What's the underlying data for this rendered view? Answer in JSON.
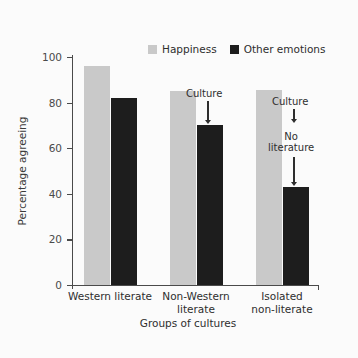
{
  "chart_data": {
    "type": "bar",
    "title": "",
    "xlabel": "Groups of cultures",
    "ylabel": "Percentage agreeing",
    "ylim": [
      0,
      100
    ],
    "yticks": [
      0,
      20,
      40,
      60,
      80,
      100
    ],
    "grid": false,
    "legend_position": "top-center",
    "categories": [
      "Western literate",
      "Non-Western\nliterate",
      "Isolated\nnon-literate"
    ],
    "series": [
      {
        "name": "Happiness",
        "color": "#c9c9c9",
        "values": [
          96,
          85,
          85.5
        ]
      },
      {
        "name": "Other emotions",
        "color": "#1d1d1d",
        "values": [
          82,
          70,
          43
        ]
      }
    ],
    "annotations": [
      {
        "text": "Culture",
        "target_group": 1,
        "target_series": "Other emotions",
        "target_value": 70
      },
      {
        "text": "Culture",
        "target_group": 2,
        "target_series": "Other emotions",
        "target_value": 70
      },
      {
        "text": "No\nliterature",
        "target_group": 2,
        "target_series": "Other emotions",
        "target_value": 43
      }
    ]
  },
  "legend": {
    "items": [
      {
        "label": "Happiness",
        "color": "#c9c9c9"
      },
      {
        "label": "Other emotions",
        "color": "#1d1d1d"
      }
    ]
  },
  "axes": {
    "y_title": "Percentage agreeing",
    "x_title": "Groups of cultures",
    "y_tick_labels": [
      "0",
      "20",
      "40",
      "60",
      "80",
      "100"
    ],
    "x_tick_labels": [
      "Western literate",
      "Non-Western\nliterate",
      "Isolated\nnon-literate"
    ]
  },
  "annotations": {
    "group2_culture": "Culture",
    "group3_culture": "Culture",
    "group3_no_literature": "No\nliterature"
  }
}
